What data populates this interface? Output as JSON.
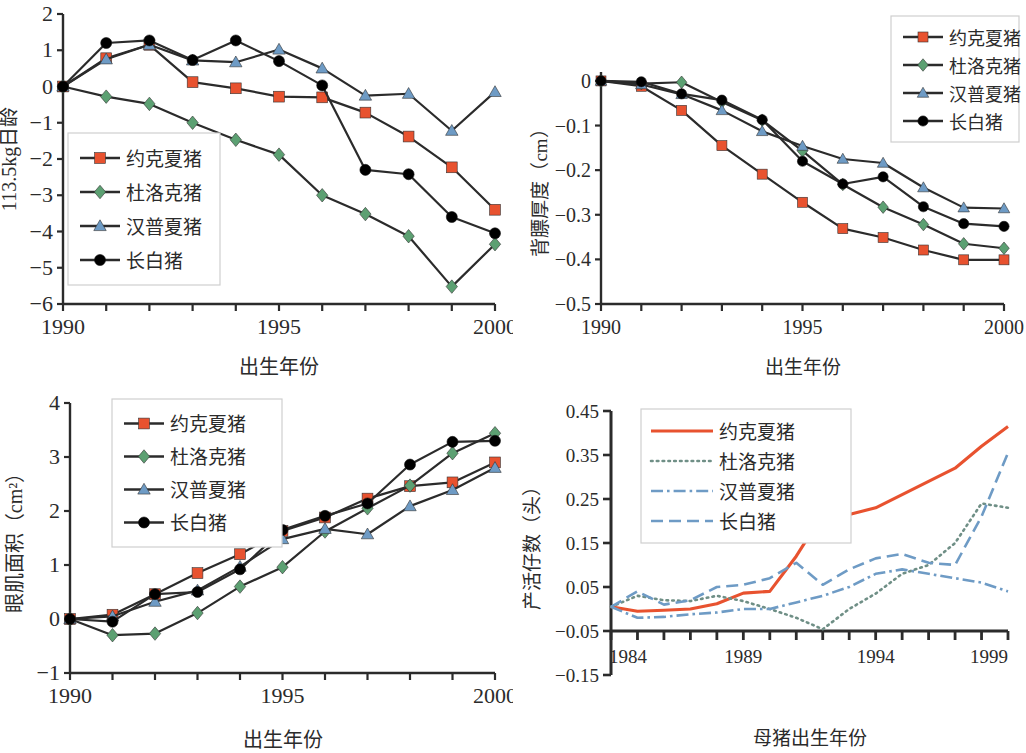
{
  "figure": {
    "background": "#ffffff",
    "panel_count": 4
  },
  "palette": {
    "yorkshire": "#E8522F",
    "duroc": "#5CA072",
    "hampshire": "#6E9BC5",
    "landrace": "#000000",
    "line": "#262626",
    "axis": "#2b2b2b",
    "legend_border": "#cfcfcf"
  },
  "series_names": {
    "yorkshire": "约克夏猪",
    "duroc": "杜洛克猪",
    "hampshire": "汉普夏猪",
    "landrace": "长白猪"
  },
  "chart_data": [
    {
      "id": "days-to-113kg",
      "type": "line",
      "title": "",
      "xlabel": "出生年份",
      "ylabel": "113.5kg日龄",
      "xlim": [
        1990,
        2000
      ],
      "ylim": [
        -6,
        2
      ],
      "xticks": [
        1990,
        1991,
        1992,
        1993,
        1994,
        1995,
        1996,
        1997,
        1998,
        1999,
        2000
      ],
      "xticklabels": [
        "1990",
        "",
        "",
        "",
        "",
        "1995",
        "",
        "",
        "",
        "",
        "2000"
      ],
      "yticks": [
        -6,
        -5,
        -4,
        -3,
        -2,
        -1,
        0,
        1,
        2
      ],
      "yticklabels": [
        "−6",
        "−5",
        "−4",
        "−3",
        "−2",
        "−1",
        "0",
        "1",
        "2"
      ],
      "grid": false,
      "legend_position": "lower-left",
      "markers": true,
      "x": [
        1990,
        1991,
        1992,
        1993,
        1994,
        1995,
        1996,
        1997,
        1998,
        1999,
        2000
      ],
      "series": [
        {
          "name": "约克夏猪",
          "key": "yorkshire",
          "marker": "square",
          "color": "#E8522F",
          "values": [
            0.0,
            0.78,
            1.15,
            0.12,
            -0.05,
            -0.28,
            -0.3,
            -0.72,
            -1.38,
            -2.23,
            -3.4,
            -3.53
          ]
        },
        {
          "name": "杜洛克猪",
          "key": "duroc",
          "marker": "diamond",
          "color": "#5CA072",
          "values": [
            0.0,
            -0.28,
            -0.48,
            -1.0,
            -1.47,
            -1.88,
            -3.0,
            -3.52,
            -4.13,
            -5.52,
            -4.35
          ]
        },
        {
          "name": "汉普夏猪",
          "key": "hampshire",
          "marker": "triangle",
          "color": "#6E9BC5",
          "values": [
            0.0,
            0.75,
            1.15,
            0.72,
            0.67,
            1.02,
            0.5,
            -0.25,
            -0.2,
            -1.22,
            -0.15
          ]
        },
        {
          "name": "长白猪",
          "key": "landrace",
          "marker": "circle",
          "color": "#000000",
          "values": [
            0.0,
            1.2,
            1.27,
            0.73,
            1.27,
            0.7,
            0.03,
            -2.3,
            -2.42,
            -3.6,
            -4.05
          ]
        }
      ]
    },
    {
      "id": "backfat-thickness",
      "type": "line",
      "title": "",
      "xlabel": "出生年份",
      "ylabel": "背膘厚度（cm）",
      "xlim": [
        1990,
        2000
      ],
      "ylim": [
        -0.5,
        0.02
      ],
      "xticks": [
        1990,
        1991,
        1992,
        1993,
        1994,
        1995,
        1996,
        1997,
        1998,
        1999,
        2000
      ],
      "xticklabels": [
        "1990",
        "",
        "",
        "",
        "",
        "1995",
        "",
        "",
        "",
        "",
        "2000"
      ],
      "yticks": [
        -0.5,
        -0.4,
        -0.3,
        -0.2,
        -0.1,
        0
      ],
      "yticklabels": [
        "−0.5",
        "−0.4",
        "−0.3",
        "−0.2",
        "−0.1",
        "0"
      ],
      "grid": false,
      "legend_position": "upper-right",
      "markers": true,
      "x": [
        1990,
        1991,
        1992,
        1993,
        1994,
        1995,
        1996,
        1997,
        1998,
        1999,
        2000
      ],
      "series": [
        {
          "name": "约克夏猪",
          "key": "yorkshire",
          "marker": "square",
          "color": "#E8522F",
          "values": [
            0.0,
            -0.012,
            -0.066,
            -0.145,
            -0.209,
            -0.272,
            -0.331,
            -0.351,
            -0.379,
            -0.401,
            -0.401
          ]
        },
        {
          "name": "杜洛克猪",
          "key": "duroc",
          "marker": "diamond",
          "color": "#5CA072",
          "values": [
            0.0,
            -0.006,
            -0.003,
            -0.047,
            -0.088,
            -0.157,
            -0.232,
            -0.283,
            -0.322,
            -0.365,
            -0.375
          ]
        },
        {
          "name": "汉普夏猪",
          "key": "hampshire",
          "marker": "triangle",
          "color": "#6E9BC5",
          "values": [
            0.0,
            -0.008,
            -0.03,
            -0.066,
            -0.113,
            -0.146,
            -0.175,
            -0.184,
            -0.239,
            -0.284,
            -0.286
          ]
        },
        {
          "name": "长白猪",
          "key": "landrace",
          "marker": "circle",
          "color": "#000000",
          "values": [
            0.0,
            -0.002,
            -0.029,
            -0.043,
            -0.087,
            -0.18,
            -0.231,
            -0.215,
            -0.282,
            -0.32,
            -0.326
          ]
        }
      ]
    },
    {
      "id": "loin-eye-area",
      "type": "line",
      "title": "",
      "xlabel": "出生年份",
      "ylabel": "眼肌面积（cm²）",
      "xlim": [
        1990,
        2000
      ],
      "ylim": [
        -1,
        4
      ],
      "xticks": [
        1990,
        1991,
        1992,
        1993,
        1994,
        1995,
        1996,
        1997,
        1998,
        1999,
        2000
      ],
      "xticklabels": [
        "1990",
        "",
        "",
        "",
        "",
        "1995",
        "",
        "",
        "",
        "",
        "2000"
      ],
      "yticks": [
        -1,
        0,
        1,
        2,
        3,
        4
      ],
      "yticklabels": [
        "−1",
        "0",
        "1",
        "2",
        "3",
        "4"
      ],
      "grid": false,
      "legend_position": "upper-left",
      "markers": true,
      "x": [
        1990,
        1991,
        1992,
        1993,
        1994,
        1995,
        1996,
        1997,
        1998,
        1999,
        2000
      ],
      "series": [
        {
          "name": "约克夏猪",
          "key": "yorkshire",
          "marker": "square",
          "color": "#E8522F",
          "values": [
            0.0,
            0.08,
            0.46,
            0.85,
            1.2,
            1.63,
            1.88,
            2.23,
            2.46,
            2.53,
            2.9
          ]
        },
        {
          "name": "杜洛克猪",
          "key": "duroc",
          "marker": "diamond",
          "color": "#5CA072",
          "values": [
            0.0,
            -0.3,
            -0.27,
            0.11,
            0.6,
            0.96,
            1.62,
            2.05,
            2.47,
            3.07,
            3.44
          ]
        },
        {
          "name": "汉普夏猪",
          "key": "hampshire",
          "marker": "triangle",
          "color": "#6E9BC5",
          "values": [
            0.0,
            0.05,
            0.32,
            0.53,
            0.97,
            1.48,
            1.67,
            1.57,
            2.09,
            2.39,
            2.8
          ]
        },
        {
          "name": "长白猪",
          "key": "landrace",
          "marker": "circle",
          "color": "#000000",
          "values": [
            0.0,
            -0.05,
            0.46,
            0.5,
            0.92,
            1.65,
            1.91,
            2.14,
            2.86,
            3.28,
            3.3
          ]
        }
      ]
    },
    {
      "id": "live-born-litter-size",
      "type": "line",
      "title": "",
      "xlabel": "母猪出生年份",
      "ylabel": "产活仔数（头）",
      "xlim": [
        1984,
        1999
      ],
      "ylim": [
        -0.15,
        0.45
      ],
      "xticks": [
        1984,
        1985,
        1986,
        1987,
        1988,
        1989,
        1990,
        1991,
        1992,
        1993,
        1994,
        1995,
        1996,
        1997,
        1998,
        1999
      ],
      "xticklabels": [
        "1984",
        "",
        "",
        "",
        "",
        "1989",
        "",
        "",
        "",
        "",
        "1994",
        "",
        "",
        "",
        "",
        "1999"
      ],
      "yticks": [
        -0.15,
        -0.05,
        0.05,
        0.15,
        0.25,
        0.35,
        0.45
      ],
      "yticklabels": [
        "−0.15",
        "−0.05",
        "0.05",
        "0.15",
        "0.25",
        "0.35",
        "0.45"
      ],
      "grid": false,
      "legend_position": "upper-left",
      "markers": false,
      "x": [
        1984,
        1985,
        1986,
        1987,
        1988,
        1989,
        1990,
        1991,
        1992,
        1993,
        1994,
        1995,
        1996,
        1997,
        1998,
        1999
      ],
      "series": [
        {
          "name": "约克夏猪",
          "key": "yorkshire",
          "dash": "solid",
          "color": "#E8522F",
          "values": [
            0.005,
            -0.005,
            -0.003,
            0.0,
            0.012,
            0.036,
            0.04,
            0.12,
            0.215,
            0.215,
            0.23,
            0.26,
            0.29,
            0.32,
            0.37,
            0.415
          ]
        },
        {
          "name": "杜洛克猪",
          "key": "duroc",
          "dash": "dotted",
          "color": "#6F8F86",
          "values": [
            0.005,
            0.03,
            0.02,
            0.018,
            0.03,
            0.018,
            0.0,
            -0.02,
            -0.046,
            0.0,
            0.035,
            0.08,
            0.1,
            0.15,
            0.24,
            0.23
          ]
        },
        {
          "name": "汉普夏猪",
          "key": "hampshire",
          "dash": "dashdot",
          "color": "#6E9BC5",
          "values": [
            0.005,
            -0.02,
            -0.018,
            -0.012,
            -0.008,
            0.0,
            0.0,
            0.015,
            0.03,
            0.05,
            0.08,
            0.09,
            0.08,
            0.07,
            0.06,
            0.04
          ]
        },
        {
          "name": "长白猪",
          "key": "landrace",
          "dash": "dashed",
          "color": "#6E9BC5",
          "values": [
            0.005,
            0.04,
            0.01,
            0.02,
            0.05,
            0.055,
            0.07,
            0.105,
            0.055,
            0.09,
            0.115,
            0.125,
            0.105,
            0.1,
            0.21,
            0.355
          ]
        }
      ]
    }
  ]
}
